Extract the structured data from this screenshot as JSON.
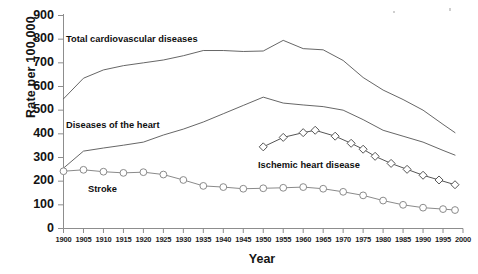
{
  "chart_data": {
    "type": "line",
    "title": "",
    "xlabel": "Year",
    "ylabel": "Rate per 100,000",
    "xlim": [
      1900,
      2000
    ],
    "ylim": [
      0,
      900
    ],
    "ytick_step": 100,
    "xtick_step": 5,
    "grid": false,
    "legend_position": "inline-annotations",
    "ytick_labels": [
      "900",
      "800",
      "700",
      "600",
      "500",
      "400",
      "300",
      "200",
      "100",
      "0"
    ],
    "ytick_values": [
      900,
      800,
      700,
      600,
      500,
      400,
      300,
      200,
      100,
      0
    ],
    "xtick_labels": [
      "1900",
      "1905",
      "1910",
      "1915",
      "1920",
      "1925",
      "1930",
      "1935",
      "1940",
      "1945",
      "1950",
      "1955",
      "1960",
      "1965",
      "1970",
      "1975",
      "1980",
      "1985",
      "1990",
      "1995",
      "2000"
    ],
    "xtick_values": [
      1900,
      1905,
      1910,
      1915,
      1920,
      1925,
      1930,
      1935,
      1940,
      1945,
      1950,
      1955,
      1960,
      1965,
      1970,
      1975,
      1980,
      1985,
      1990,
      1995,
      2000
    ],
    "series": [
      {
        "name": "Total cardiovascular diseases",
        "annotation": "Total cardiovascular diseases",
        "marker": "none",
        "color": "#555555",
        "x": [
          1900,
          1905,
          1910,
          1915,
          1920,
          1925,
          1930,
          1935,
          1940,
          1945,
          1950,
          1955,
          1960,
          1965,
          1970,
          1975,
          1980,
          1985,
          1990,
          1995,
          1998
        ],
        "values": [
          548,
          635,
          670,
          688,
          700,
          712,
          730,
          752,
          752,
          748,
          750,
          795,
          760,
          755,
          710,
          638,
          585,
          545,
          500,
          440,
          405
        ]
      },
      {
        "name": "Diseases of the heart",
        "annotation": "Diseases of the heart",
        "marker": "none",
        "color": "#555555",
        "x": [
          1900,
          1905,
          1910,
          1915,
          1920,
          1925,
          1930,
          1935,
          1940,
          1945,
          1950,
          1955,
          1960,
          1965,
          1970,
          1975,
          1980,
          1985,
          1990,
          1995,
          1998
        ],
        "values": [
          255,
          327,
          340,
          352,
          365,
          395,
          420,
          450,
          485,
          520,
          555,
          530,
          522,
          515,
          500,
          460,
          415,
          390,
          365,
          330,
          310
        ]
      },
      {
        "name": "Ischemic heart disease",
        "annotation": "Ischemic heart disease",
        "marker": "diamond",
        "color": "#555555",
        "x": [
          1950,
          1955,
          1960,
          1963,
          1968,
          1972,
          1975,
          1978,
          1982,
          1986,
          1990,
          1994,
          1998
        ],
        "values": [
          345,
          385,
          405,
          415,
          390,
          360,
          335,
          305,
          275,
          250,
          225,
          205,
          185
        ]
      },
      {
        "name": "Stroke",
        "annotation": "Stroke",
        "marker": "circle",
        "color": "#8a8a8a",
        "x": [
          1900,
          1905,
          1910,
          1915,
          1920,
          1925,
          1930,
          1935,
          1940,
          1945,
          1950,
          1955,
          1960,
          1965,
          1970,
          1975,
          1980,
          1985,
          1990,
          1995,
          1998
        ],
        "values": [
          242,
          248,
          240,
          235,
          238,
          228,
          205,
          180,
          175,
          168,
          170,
          172,
          175,
          168,
          155,
          140,
          118,
          100,
          88,
          82,
          78
        ]
      }
    ],
    "annotation_positions": {
      "total_cvd": {
        "x": 66,
        "y": 34
      },
      "diseases_heart": {
        "x": 66,
        "y": 120
      },
      "ischemic": {
        "x": 258,
        "y": 160
      },
      "stroke": {
        "x": 88,
        "y": 184
      }
    },
    "axis_colors": {
      "axis_line": "#8d8d8d",
      "tick": "#8d8d8d",
      "line_default": "#555555",
      "stroke_series": "#8a8a8a"
    }
  }
}
